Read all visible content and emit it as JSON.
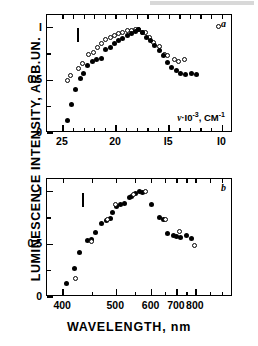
{
  "figure": {
    "y_axis_title": "LUMINESCENCE INTENSITY, ARB.UN.",
    "panel_a_letter": "a",
    "panel_b_letter": "b",
    "annotation_nu": "·I0",
    "annotation_nu_symbol": "ν",
    "annotation_nu_exp": "-3",
    "annotation_nu_unit": ", CM",
    "annotation_nu_unit_exp": "-1",
    "x_axis_title_b": "WAVELENGTH, nm"
  },
  "chart_data": [
    {
      "type": "scatter",
      "panel": "a",
      "title": "",
      "xlabel": "ν·10⁻³, CM⁻¹",
      "ylabel": "LUMINESCENCE INTENSITY, ARB.UN.",
      "xlim": [
        26.5,
        9.0
      ],
      "ylim": [
        0,
        1.12
      ],
      "x_ticks_major": [
        25,
        20,
        15,
        10
      ],
      "x_tick_labels": [
        "25",
        "20",
        "I5",
        "I0"
      ],
      "x_ticks_minor": [
        24,
        23,
        22,
        21,
        19,
        18,
        17,
        16,
        14,
        13,
        12,
        11
      ],
      "y_ticks_major": [
        0,
        0.5,
        1
      ],
      "y_tick_labels": [
        "0",
        "0.5",
        "I"
      ],
      "y_ticks_minor": [
        0.25,
        0.75
      ],
      "grid": false,
      "legend": "none",
      "error_bar": {
        "x": 23.6,
        "y_center": 0.93,
        "y_half": 0.065
      },
      "series": [
        {
          "name": "open-circles",
          "marker": "open",
          "points": [
            {
              "x": 24.55,
              "y": 0.5
            },
            {
              "x": 24.25,
              "y": 0.545
            },
            {
              "x": 23.55,
              "y": 0.615
            },
            {
              "x": 23.15,
              "y": 0.655
            },
            {
              "x": 22.55,
              "y": 0.745
            },
            {
              "x": 22.15,
              "y": 0.765
            },
            {
              "x": 21.75,
              "y": 0.815
            },
            {
              "x": 21.35,
              "y": 0.845
            },
            {
              "x": 20.95,
              "y": 0.885
            },
            {
              "x": 20.55,
              "y": 0.905
            },
            {
              "x": 20.15,
              "y": 0.925
            },
            {
              "x": 19.75,
              "y": 0.945
            },
            {
              "x": 19.35,
              "y": 0.95
            },
            {
              "x": 18.95,
              "y": 0.97
            },
            {
              "x": 18.55,
              "y": 0.975
            },
            {
              "x": 18.15,
              "y": 0.985
            },
            {
              "x": 17.85,
              "y": 0.985
            },
            {
              "x": 17.55,
              "y": 0.95
            },
            {
              "x": 17.25,
              "y": 0.955
            },
            {
              "x": 16.85,
              "y": 0.905
            },
            {
              "x": 16.45,
              "y": 0.855
            },
            {
              "x": 15.95,
              "y": 0.825
            },
            {
              "x": 15.45,
              "y": 0.745
            },
            {
              "x": 15.15,
              "y": 0.735
            },
            {
              "x": 14.55,
              "y": 0.695
            },
            {
              "x": 14.15,
              "y": 0.675
            },
            {
              "x": 13.55,
              "y": 0.695
            },
            {
              "x": 10.35,
              "y": 1.01
            }
          ]
        },
        {
          "name": "filled-circles",
          "marker": "filled",
          "points": [
            {
              "x": 24.55,
              "y": 0.115
            },
            {
              "x": 24.15,
              "y": 0.275
            },
            {
              "x": 23.85,
              "y": 0.415
            },
            {
              "x": 23.35,
              "y": 0.52
            },
            {
              "x": 23.05,
              "y": 0.565
            },
            {
              "x": 22.65,
              "y": 0.645
            },
            {
              "x": 22.25,
              "y": 0.675
            },
            {
              "x": 21.85,
              "y": 0.7
            },
            {
              "x": 21.35,
              "y": 0.705
            },
            {
              "x": 20.95,
              "y": 0.795
            },
            {
              "x": 20.55,
              "y": 0.815
            },
            {
              "x": 20.15,
              "y": 0.845
            },
            {
              "x": 19.75,
              "y": 0.875
            },
            {
              "x": 19.35,
              "y": 0.895
            },
            {
              "x": 18.95,
              "y": 0.925
            },
            {
              "x": 18.55,
              "y": 0.945
            },
            {
              "x": 18.15,
              "y": 0.965
            },
            {
              "x": 17.85,
              "y": 0.985
            },
            {
              "x": 17.55,
              "y": 0.95
            },
            {
              "x": 17.15,
              "y": 0.905
            },
            {
              "x": 16.75,
              "y": 0.875
            },
            {
              "x": 16.35,
              "y": 0.835
            },
            {
              "x": 15.95,
              "y": 0.785
            },
            {
              "x": 15.55,
              "y": 0.735
            },
            {
              "x": 15.15,
              "y": 0.665
            },
            {
              "x": 14.75,
              "y": 0.625
            },
            {
              "x": 14.35,
              "y": 0.595
            },
            {
              "x": 13.95,
              "y": 0.565
            },
            {
              "x": 13.45,
              "y": 0.555
            },
            {
              "x": 12.95,
              "y": 0.565
            },
            {
              "x": 12.45,
              "y": 0.555
            }
          ]
        }
      ]
    },
    {
      "type": "scatter",
      "panel": "b",
      "title": "",
      "xlabel": "WAVELENGTH, nm",
      "ylabel": "LUMINESCENCE INTENSITY, ARB.UN.",
      "x_scale": "reciprocal",
      "xlim": [
        377,
        1111
      ],
      "ylim": [
        0,
        1.12
      ],
      "x_ticks_major": [
        400,
        500,
        600,
        700,
        800
      ],
      "x_tick_labels": [
        "400",
        "500",
        "600",
        "700",
        "800"
      ],
      "x_ticks_minor": [
        450,
        550,
        650,
        750,
        900,
        1000
      ],
      "y_ticks_major": [
        0,
        0.5,
        1
      ],
      "y_tick_labels": [
        "0",
        "0.5",
        "I"
      ],
      "y_ticks_minor": [
        0.25,
        0.75
      ],
      "grid": false,
      "legend": "none",
      "error_bar": {
        "x": 432,
        "y_center": 0.92,
        "y_half": 0.065
      },
      "series": [
        {
          "name": "filled-circles",
          "marker": "filled",
          "points": [
            {
              "x": 405,
              "y": 0.125
            },
            {
              "x": 417,
              "y": 0.275
            },
            {
              "x": 427,
              "y": 0.425
            },
            {
              "x": 440,
              "y": 0.535
            },
            {
              "x": 447,
              "y": 0.545
            },
            {
              "x": 455,
              "y": 0.615
            },
            {
              "x": 468,
              "y": 0.695
            },
            {
              "x": 478,
              "y": 0.725
            },
            {
              "x": 487,
              "y": 0.745
            },
            {
              "x": 492,
              "y": 0.8
            },
            {
              "x": 500,
              "y": 0.855
            },
            {
              "x": 510,
              "y": 0.875
            },
            {
              "x": 520,
              "y": 0.885
            },
            {
              "x": 532,
              "y": 0.945
            },
            {
              "x": 540,
              "y": 0.955
            },
            {
              "x": 550,
              "y": 0.985
            },
            {
              "x": 560,
              "y": 1.0
            },
            {
              "x": 572,
              "y": 0.995
            },
            {
              "x": 600,
              "y": 0.875
            },
            {
              "x": 628,
              "y": 0.755
            },
            {
              "x": 645,
              "y": 0.735
            },
            {
              "x": 660,
              "y": 0.605
            },
            {
              "x": 685,
              "y": 0.585
            },
            {
              "x": 700,
              "y": 0.575
            },
            {
              "x": 715,
              "y": 0.565
            },
            {
              "x": 745,
              "y": 0.585
            },
            {
              "x": 775,
              "y": 0.555
            }
          ]
        },
        {
          "name": "open-circles",
          "marker": "open",
          "points": [
            {
              "x": 420,
              "y": 0.175
            },
            {
              "x": 448,
              "y": 0.525
            },
            {
              "x": 480,
              "y": 0.735
            },
            {
              "x": 498,
              "y": 0.875
            },
            {
              "x": 545,
              "y": 0.975
            },
            {
              "x": 580,
              "y": 1.0
            },
            {
              "x": 650,
              "y": 0.735
            },
            {
              "x": 712,
              "y": 0.625
            },
            {
              "x": 792,
              "y": 0.49
            }
          ]
        }
      ]
    }
  ]
}
